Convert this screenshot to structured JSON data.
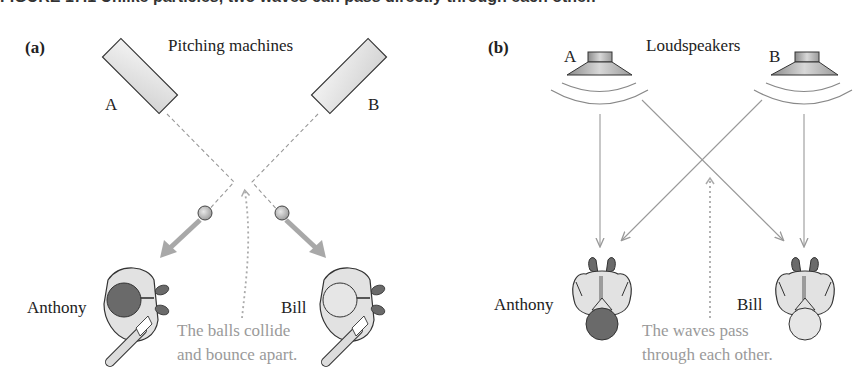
{
  "caption": {
    "text": "FIGURE 17.1 Unlike particles, two waves can pass directly through each other."
  },
  "panel_a": {
    "label": "(a)",
    "title": "Pitching machines",
    "machine_a_label": "A",
    "machine_b_label": "B",
    "person_left": "Anthony",
    "person_right": "Bill",
    "note_line1": "The balls collide",
    "note_line2": "and bounce apart."
  },
  "panel_b": {
    "label": "(b)",
    "title": "Loudspeakers",
    "speaker_a_label": "A",
    "speaker_b_label": "B",
    "person_left": "Anthony",
    "person_right": "Bill",
    "note_line1": "The waves pass",
    "note_line2": "through each other."
  },
  "colors": {
    "arrow_gray": "#a8a8a8",
    "line_gray": "#9a9a9a",
    "note_gray": "#9a9a9a",
    "outline": "#333333",
    "fill_light": "#e2e2e2",
    "fill_dark": "#6a6a6a"
  }
}
